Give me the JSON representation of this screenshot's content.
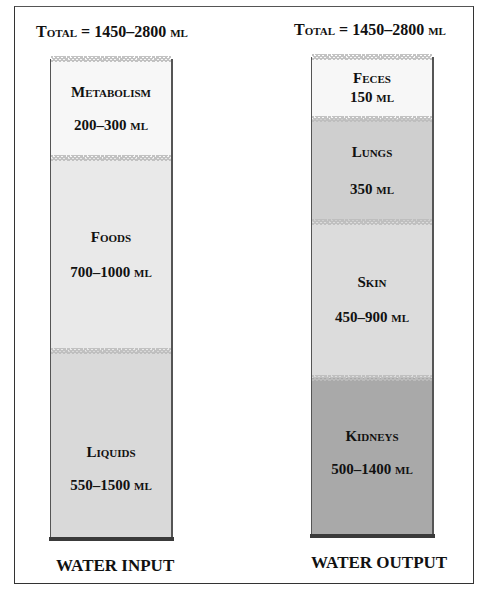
{
  "diagram": {
    "input": {
      "total_prefix": "Total",
      "total_value": " = 1450–2800 ",
      "total_unit": "ml",
      "caption": "WATER INPUT",
      "segments": [
        {
          "name": "Metabolism",
          "amount": "200–300 ",
          "unit": "ml",
          "color": "#f7f7f7"
        },
        {
          "name": "Foods",
          "amount": "700–1000 ",
          "unit": "ml",
          "color": "#e9e9e9"
        },
        {
          "name": "Liquids",
          "amount": "550–1500 ",
          "unit": "ml",
          "color": "#d7d7d7"
        }
      ]
    },
    "output": {
      "total_prefix": "Total",
      "total_value": " = 1450–2800 ",
      "total_unit": "ml",
      "caption": "WATER OUTPUT",
      "segments": [
        {
          "name": "Feces",
          "amount": "150 ",
          "unit": "ml",
          "color": "#f7f7f7"
        },
        {
          "name": "Lungs",
          "amount": "350 ",
          "unit": "ml",
          "color": "#cfcfcf"
        },
        {
          "name": "Skin",
          "amount": "450–900 ",
          "unit": "ml",
          "color": "#dcdcdc"
        },
        {
          "name": "Kidneys",
          "amount": "500–1400 ",
          "unit": "ml",
          "color": "#a9a9a9"
        }
      ]
    }
  }
}
